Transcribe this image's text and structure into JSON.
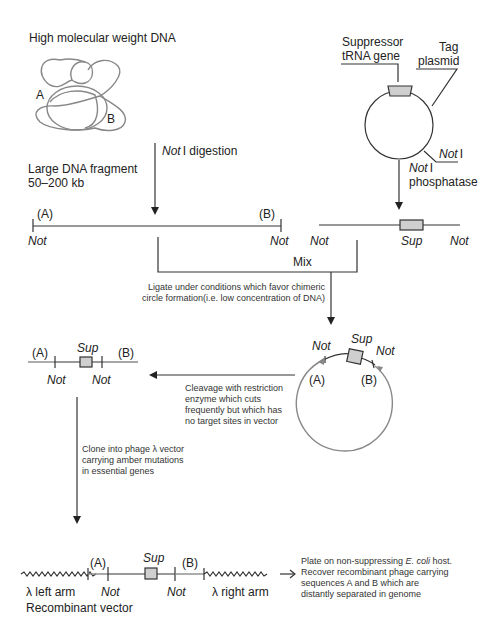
{
  "genomic": {
    "title": "High molecular weight DNA",
    "label_a": "A",
    "label_b": "B"
  },
  "plasmid": {
    "suppressor_line1": "Suppressor",
    "suppressor_line2": "tRNA gene",
    "tag_line1": "Tag",
    "tag_line2": "plasmid",
    "site_label": "Not",
    "site_suffix": "I"
  },
  "step_digestion": {
    "enzyme": "Not",
    "suffix": "I digestion"
  },
  "step_phosphatase": {
    "enzyme": "Not",
    "suffix": "I",
    "line2": "phosphatase"
  },
  "fragment": {
    "line1": "Large DNA fragment",
    "line2": "50–200 kb",
    "end_a": "(A)",
    "end_b": "(B)",
    "site_left": "Not",
    "site_right": "Not"
  },
  "linear_plasmid": {
    "site_left": "Not",
    "marker": "Sup",
    "site_right": "Not"
  },
  "mix": {
    "label": "Mix"
  },
  "ligation": {
    "line1": "Ligate under conditions which favor chimeric",
    "line2": "circle formation(i.e. low concentration of DNA)"
  },
  "chimeric_circle": {
    "site_left": "Not",
    "marker": "Sup",
    "site_right": "Not",
    "end_a": "(A)",
    "end_b": "(B)"
  },
  "cleavage": {
    "line1": "Cleavage with restriction",
    "line2": "enzyme which cuts",
    "line3": "frequently but which has",
    "line4": "no target sites in vector"
  },
  "insert": {
    "end_a": "(A)",
    "marker": "Sup",
    "end_b": "(B)",
    "site_left": "Not",
    "site_right": "Not"
  },
  "cloning": {
    "line1": "Clone into phage λ vector",
    "line2": "carrying amber mutations",
    "line3": "in essential genes"
  },
  "recombinant": {
    "end_a": "(A)",
    "marker": "Sup",
    "end_b": "(B)",
    "left_arm": "λ left arm",
    "site_left": "Not",
    "site_right": "Not",
    "right_arm": "λ right arm",
    "caption": "Recombinant vector"
  },
  "plating": {
    "line1_pre": "Plate on non-suppressing ",
    "line1_species": "E. coli",
    "line1_post": " host.",
    "line2": "Recover recombinant phage carrying",
    "line3": "sequences A and B which are",
    "line4": "distantly separated in genome"
  },
  "colors": {
    "line": "#333333",
    "genomic_dna": "#888888",
    "sup_box": "#cfcfcf"
  }
}
